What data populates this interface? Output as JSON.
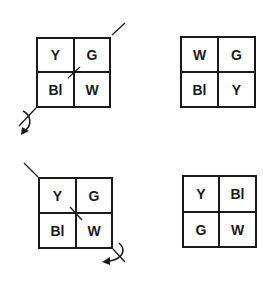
{
  "diagram": {
    "colors": {
      "ink": "#1a1a1a",
      "background": "#ffffff"
    },
    "panels": [
      {
        "id": "top-left",
        "role": "before",
        "cells": [
          "Y",
          "G",
          "Bl",
          "W"
        ],
        "rotation_axis": "diagonal-bottom-left-to-top-right",
        "rotation_arrow": "bottom-left"
      },
      {
        "id": "top-right",
        "role": "after",
        "cells": [
          "W",
          "G",
          "Bl",
          "Y"
        ]
      },
      {
        "id": "bottom-left",
        "role": "before",
        "cells": [
          "Y",
          "G",
          "Bl",
          "W"
        ],
        "rotation_axis": "diagonal-top-left-to-bottom-right",
        "rotation_arrow": "bottom-right"
      },
      {
        "id": "bottom-right",
        "role": "after",
        "cells": [
          "Y",
          "Bl",
          "G",
          "W"
        ]
      }
    ]
  }
}
